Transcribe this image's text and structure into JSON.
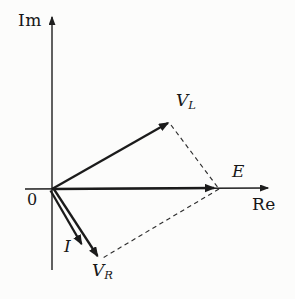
{
  "figure": {
    "type": "phasor-vector-diagram",
    "ink_color": "#1b1b1b",
    "background_color": "#fcfcfb"
  },
  "labels": {
    "im": {
      "text": "Im"
    },
    "re": {
      "text": "Re"
    },
    "origin": {
      "text": "0"
    },
    "vl": {
      "main": "V",
      "sub": "L"
    },
    "e": {
      "main": "E"
    },
    "i": {
      "main": "I"
    },
    "vr": {
      "main": "V",
      "sub": "R"
    }
  },
  "diagram": {
    "origin": [
      52,
      189
    ],
    "axes": [
      {
        "name": "im-axis",
        "from": [
          52,
          270
        ],
        "to": [
          52,
          17
        ]
      },
      {
        "name": "re-axis",
        "from": [
          25,
          189
        ],
        "to": [
          268,
          188
        ]
      }
    ],
    "vectors": [
      {
        "name": "vector-vl",
        "from": [
          52,
          189
        ],
        "to": [
          168,
          123
        ]
      },
      {
        "name": "vector-e",
        "from": [
          52,
          189
        ],
        "to": [
          214,
          188
        ]
      },
      {
        "name": "vector-i",
        "from": [
          50.5,
          190.5
        ],
        "to": [
          81.5,
          244
        ]
      },
      {
        "name": "vector-vr",
        "from": [
          53.5,
          188.5
        ],
        "to": [
          97.5,
          256
        ]
      }
    ],
    "dashed_lines": [
      {
        "name": "dash-vl-to-corner",
        "from": [
          171,
          125
        ],
        "to": [
          219,
          189
        ]
      },
      {
        "name": "dash-corner-to-vr",
        "from": [
          219,
          189
        ],
        "to": [
          101,
          259
        ]
      }
    ]
  }
}
